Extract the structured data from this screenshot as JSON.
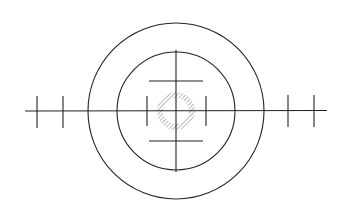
{
  "diagram": {
    "type": "reticle",
    "background": "#ffffff",
    "stroke_color": "#222222",
    "hatch_color": "#8a8a8a",
    "center": {
      "x": 176,
      "y": 111
    },
    "outer_circle": {
      "r": 88
    },
    "inner_circle": {
      "r": 59
    },
    "horizontal_axis": {
      "x1": 25,
      "x2": 327
    },
    "vertical_axis": {
      "y1": 50,
      "y2": 172
    },
    "horizontal_bars": [
      {
        "y": 81,
        "x1": 149,
        "x2": 203
      },
      {
        "y": 141,
        "x1": 149,
        "x2": 203
      }
    ],
    "inner_ticks": [
      {
        "x": 147,
        "y1": 96,
        "y2": 126
      },
      {
        "x": 206,
        "y1": 96,
        "y2": 126
      }
    ],
    "outer_ticks": [
      {
        "x": 37,
        "y1": 96,
        "y2": 128
      },
      {
        "x": 63,
        "y1": 96,
        "y2": 128
      },
      {
        "x": 288,
        "y1": 95,
        "y2": 127
      },
      {
        "x": 314,
        "y1": 95,
        "y2": 127
      }
    ],
    "hatched_ring": {
      "r": 16,
      "width": 6
    }
  }
}
